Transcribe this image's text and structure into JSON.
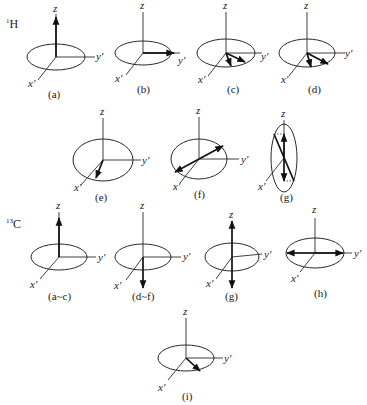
{
  "figure": {
    "section_labels": {
      "h1": {
        "mass": "1",
        "element": "H"
      },
      "c13": {
        "mass": "13",
        "element": "C"
      }
    },
    "axis_labels": {
      "z": "z",
      "x": "x′",
      "y": "y′"
    },
    "panels_1H": [
      {
        "caption": "(a)",
        "vector": "along +z"
      },
      {
        "caption": "(b)",
        "vector": "along +y′"
      },
      {
        "caption": "(c)",
        "vector": "two vectors fanning out in xy plane"
      },
      {
        "caption": "(d)",
        "vector": "two vectors further apart in xy plane"
      },
      {
        "caption": "(e)",
        "vector": "vector pointing toward x′"
      },
      {
        "caption": "(f)",
        "vector": "two antiparallel vectors in xy plane"
      },
      {
        "caption": "(g)",
        "vector": "two antiparallel vectors rotated to ±z"
      }
    ],
    "panels_13C": [
      {
        "caption": "(a~c)",
        "vector": "along +z"
      },
      {
        "caption": "(d~f)",
        "vector": "along −z"
      },
      {
        "caption": "(g)",
        "vector": "along +z and −z"
      },
      {
        "caption": "(h)",
        "vector": "along +y′ and −y′"
      },
      {
        "caption": "(i)",
        "vector": "single vector in xy plane"
      }
    ]
  }
}
